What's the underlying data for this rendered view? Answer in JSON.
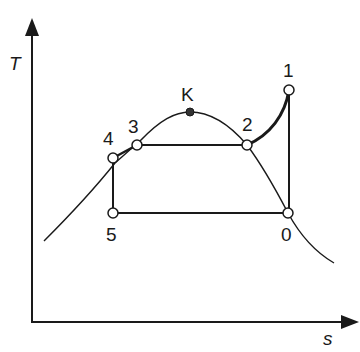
{
  "diagram": {
    "type": "T-s diagram (refrigeration cycle)",
    "axes": {
      "y_label": "T",
      "x_label": "s"
    },
    "critical_point": {
      "label": "K"
    },
    "points": [
      {
        "id": "1",
        "label": "1"
      },
      {
        "id": "2",
        "label": "2"
      },
      {
        "id": "3",
        "label": "3"
      },
      {
        "id": "4",
        "label": "4"
      },
      {
        "id": "5",
        "label": "5"
      },
      {
        "id": "0",
        "label": "0"
      }
    ],
    "processes": [
      "0-1 vertical (isentropic compression)",
      "1-2 superheated vapor cooling",
      "2-3 condensation",
      "3-4 subcooling",
      "4-5 vertical",
      "5-0 evaporation"
    ],
    "colors": {
      "line": "#1a1a1a",
      "background": "#ffffff",
      "marker_fill": "#ffffff",
      "critical_fill": "#333333"
    }
  }
}
